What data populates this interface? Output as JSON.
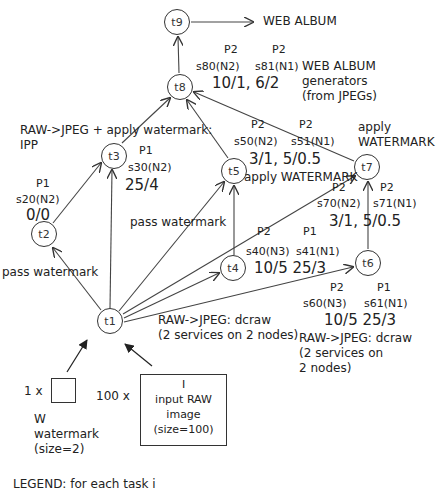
{
  "tasks": {
    "t1": {
      "label": "t1"
    },
    "t2": {
      "label": "t2",
      "proc": "P1",
      "services": "s20(N2)",
      "costs": "0/0"
    },
    "t3": {
      "label": "t3",
      "proc": "P1",
      "services": "s30(N2)",
      "costs": "25/4"
    },
    "t4": {
      "label": "t4",
      "proc_a": "P2",
      "proc_b": "P1",
      "service_a": "s40(N3)",
      "service_b": "s41(N1)",
      "costs": "10/5 25/3"
    },
    "t5": {
      "label": "t5",
      "proc_a": "P2",
      "proc_b": "P2",
      "service_a": "s50(N2)",
      "service_b": "s51(N1)",
      "costs": "3/1, 5/0.5"
    },
    "t6": {
      "label": "t6",
      "proc_a": "P2",
      "proc_b": "P1",
      "service_a": "s60(N3)",
      "service_b": "s61(N1)",
      "costs": "10/5 25/3"
    },
    "t7": {
      "label": "t7",
      "proc_a": "P2",
      "proc_b": "P2",
      "service_a": "s70(N2)",
      "service_b": "s71(N1)",
      "costs": "3/1, 5/0.5"
    },
    "t8": {
      "label": "t8",
      "proc_a": "P2",
      "proc_b": "P2",
      "service_a": "s80(N2)",
      "service_b": "s81(N1)",
      "costs": "10/1, 6/2"
    },
    "t9": {
      "label": "t9"
    }
  },
  "annotations": {
    "web_album_output": "WEB ALBUM",
    "web_album_gen_1": "WEB ALBUM",
    "web_album_gen_2": "generators",
    "web_album_gen_3": "(from JPEGs)",
    "t3_desc_1": "RAW->JPEG + apply watermark:",
    "t3_desc_2": "IPP",
    "t7_desc_1": "apply",
    "t7_desc_2": "WATERMARK",
    "t5_desc": "apply WATERMARK",
    "pass_watermark_t5": "pass watermark",
    "pass_watermark_t2": "pass watermark",
    "t4_desc_1": "RAW->JPEG: dcraw",
    "t4_desc_2": "(2 services on 2 nodes)",
    "t6_desc_1": "RAW->JPEG: dcraw",
    "t6_desc_2": "(2 services on",
    "t6_desc_3": "2 nodes)"
  },
  "inputs": {
    "watermark": {
      "multiplier": "1 x",
      "name": "W",
      "desc": "watermark",
      "size": "(size=2)"
    },
    "raw_image": {
      "multiplier": "100 x",
      "name": "I",
      "desc_1": "input RAW",
      "desc_2": "image",
      "size": "(size=100)"
    }
  },
  "legend": {
    "title": "LEGEND: for each task i"
  }
}
